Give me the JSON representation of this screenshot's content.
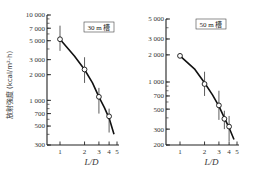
{
  "chart_data": [
    {
      "type": "line",
      "title": "30 m 槽",
      "xlabel": "L/D",
      "ylabel": "放射強度 (kcal/m²·h)",
      "xscale": "log",
      "yscale": "log",
      "xlim": [
        0.75,
        5
      ],
      "ylim": [
        300,
        10000
      ],
      "x_ticks": [
        1,
        2,
        3,
        4,
        5
      ],
      "y_ticks": [
        300,
        500,
        700,
        1000,
        2000,
        3000,
        5000,
        7000,
        10000
      ],
      "y_tick_labels": [
        "300",
        "500",
        "700",
        "1 000",
        "2 000",
        "3 000",
        "5 000",
        "7 000",
        "10 000"
      ],
      "grid": false,
      "legend_position": "top-right",
      "series": [
        {
          "name": "measured",
          "marker": "open-circle",
          "x": [
            1,
            2,
            3,
            4
          ],
          "y": [
            5200,
            2300,
            1100,
            650
          ],
          "error_low": [
            3800,
            1600,
            700,
            420
          ],
          "error_high": [
            7500,
            3200,
            1400,
            800
          ]
        },
        {
          "name": "fit-curve",
          "marker": "none",
          "x": [
            1,
            1.5,
            2,
            2.5,
            3,
            3.5,
            4,
            4.6
          ],
          "y": [
            5200,
            3300,
            2300,
            1600,
            1100,
            820,
            620,
            400
          ]
        }
      ]
    },
    {
      "type": "line",
      "title": "50 m 槽",
      "xlabel": "L/D",
      "ylabel": "",
      "xscale": "log",
      "yscale": "log",
      "xlim": [
        0.75,
        5
      ],
      "ylim": [
        200,
        5000
      ],
      "x_ticks": [
        1,
        2,
        3,
        4,
        5
      ],
      "y_ticks": [
        200,
        300,
        500,
        700,
        1000,
        2000,
        3000,
        5000
      ],
      "y_tick_labels": [
        "200",
        "300",
        "500",
        "700",
        "1 000",
        "2 000",
        "3 000",
        "5 000"
      ],
      "grid": false,
      "legend_position": "top-right",
      "series": [
        {
          "name": "measured",
          "marker": "open-circle",
          "x": [
            1,
            2,
            3,
            3.5,
            4
          ],
          "y": [
            1950,
            950,
            550,
            390,
            320
          ],
          "error_low": [
            1950,
            700,
            380,
            300,
            220
          ],
          "error_high": [
            1950,
            1300,
            800,
            480,
            420
          ]
        },
        {
          "name": "fit-curve",
          "marker": "none",
          "x": [
            1,
            1.5,
            2,
            2.5,
            3,
            3.5,
            4,
            4.6
          ],
          "y": [
            1950,
            1400,
            980,
            720,
            540,
            400,
            310,
            230
          ]
        }
      ]
    }
  ],
  "left": {
    "legend": "30 m 槽",
    "ylabel": "放射強度 (kcal/m²·h)",
    "xlabel": "L/D"
  },
  "right": {
    "legend": "50 m 槽",
    "xlabel": "L/D"
  }
}
